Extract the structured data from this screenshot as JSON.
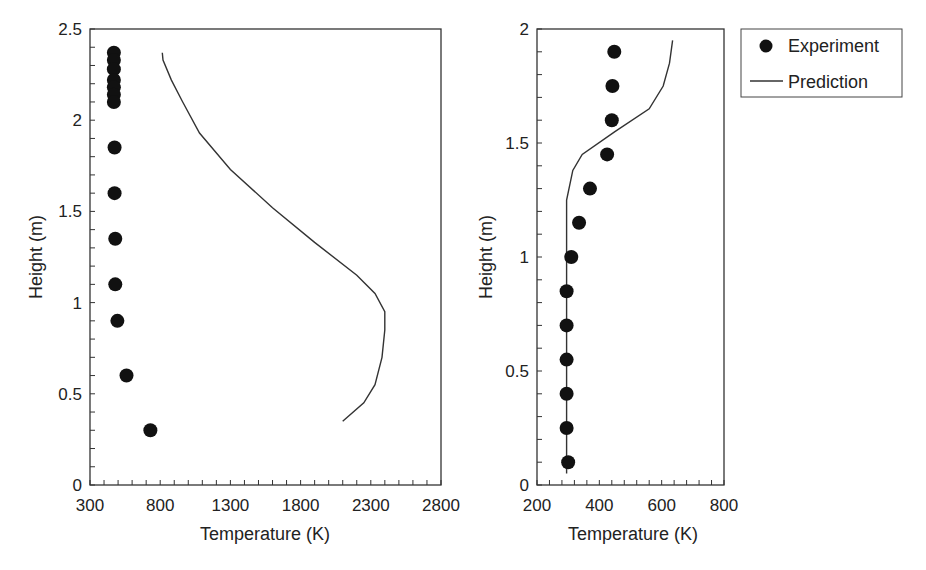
{
  "chart_data": [
    {
      "type": "scatter",
      "title": "",
      "xlabel": "Temperature (K)",
      "ylabel": "Height (m)",
      "xlim": [
        300,
        2800
      ],
      "ylim": [
        0,
        2.5
      ],
      "xticks": [
        300,
        800,
        1300,
        1800,
        2300,
        2800
      ],
      "yticks": [
        0,
        0.5,
        1,
        1.5,
        2,
        2.5
      ],
      "grid": false,
      "series": [
        {
          "name": "Experiment",
          "marker": "filled-circle",
          "points": [
            {
              "x": 470,
              "y": 2.37
            },
            {
              "x": 470,
              "y": 2.33
            },
            {
              "x": 470,
              "y": 2.28
            },
            {
              "x": 470,
              "y": 2.22
            },
            {
              "x": 470,
              "y": 2.18
            },
            {
              "x": 470,
              "y": 2.14
            },
            {
              "x": 470,
              "y": 2.1
            },
            {
              "x": 475,
              "y": 1.85
            },
            {
              "x": 475,
              "y": 1.6
            },
            {
              "x": 480,
              "y": 1.35
            },
            {
              "x": 480,
              "y": 1.1
            },
            {
              "x": 495,
              "y": 0.9
            },
            {
              "x": 560,
              "y": 0.6
            },
            {
              "x": 730,
              "y": 0.3
            }
          ]
        },
        {
          "name": "Prediction",
          "marker": "line",
          "points": [
            {
              "x": 2100,
              "y": 0.35
            },
            {
              "x": 2250,
              "y": 0.45
            },
            {
              "x": 2330,
              "y": 0.55
            },
            {
              "x": 2380,
              "y": 0.7
            },
            {
              "x": 2400,
              "y": 0.85
            },
            {
              "x": 2400,
              "y": 0.95
            },
            {
              "x": 2330,
              "y": 1.05
            },
            {
              "x": 2200,
              "y": 1.15
            },
            {
              "x": 1900,
              "y": 1.33
            },
            {
              "x": 1600,
              "y": 1.52
            },
            {
              "x": 1300,
              "y": 1.73
            },
            {
              "x": 1080,
              "y": 1.93
            },
            {
              "x": 960,
              "y": 2.1
            },
            {
              "x": 880,
              "y": 2.22
            },
            {
              "x": 820,
              "y": 2.33
            },
            {
              "x": 815,
              "y": 2.37
            }
          ]
        }
      ]
    },
    {
      "type": "scatter",
      "title": "",
      "xlabel": "Temperature (K)",
      "ylabel": "Height (m)",
      "xlim": [
        200,
        800
      ],
      "ylim": [
        0,
        2
      ],
      "xticks": [
        200,
        400,
        600,
        800
      ],
      "yticks": [
        0,
        0.5,
        1,
        1.5,
        2
      ],
      "grid": false,
      "series": [
        {
          "name": "Experiment",
          "marker": "filled-circle",
          "points": [
            {
              "x": 300,
              "y": 0.1
            },
            {
              "x": 295,
              "y": 0.25
            },
            {
              "x": 295,
              "y": 0.4
            },
            {
              "x": 295,
              "y": 0.55
            },
            {
              "x": 295,
              "y": 0.7
            },
            {
              "x": 295,
              "y": 0.85
            },
            {
              "x": 310,
              "y": 1.0
            },
            {
              "x": 335,
              "y": 1.15
            },
            {
              "x": 370,
              "y": 1.3
            },
            {
              "x": 425,
              "y": 1.45
            },
            {
              "x": 440,
              "y": 1.6
            },
            {
              "x": 442,
              "y": 1.75
            },
            {
              "x": 448,
              "y": 1.9
            }
          ]
        },
        {
          "name": "Prediction",
          "marker": "line",
          "points": [
            {
              "x": 295,
              "y": 0.05
            },
            {
              "x": 295,
              "y": 1.25
            },
            {
              "x": 315,
              "y": 1.38
            },
            {
              "x": 345,
              "y": 1.45
            },
            {
              "x": 450,
              "y": 1.55
            },
            {
              "x": 560,
              "y": 1.65
            },
            {
              "x": 605,
              "y": 1.75
            },
            {
              "x": 625,
              "y": 1.85
            },
            {
              "x": 635,
              "y": 1.95
            }
          ]
        }
      ]
    }
  ],
  "legend": {
    "items": [
      {
        "label": "Experiment",
        "symbol": "filled-circle"
      },
      {
        "label": "Prediction",
        "symbol": "line"
      }
    ]
  },
  "left_chart": {
    "xlabel": "Temperature (K)",
    "ylabel": "Height (m)",
    "xtick_labels": [
      "300",
      "800",
      "1300",
      "1800",
      "2300",
      "2800"
    ],
    "ytick_labels": [
      "0",
      "0.5",
      "1",
      "1.5",
      "2",
      "2.5"
    ]
  },
  "right_chart": {
    "xlabel": "Temperature (K)",
    "ylabel": "Height (m)",
    "xtick_labels": [
      "200",
      "400",
      "600",
      "800"
    ],
    "ytick_labels": [
      "0",
      "0.5",
      "1",
      "1.5",
      "2"
    ]
  },
  "colors": {
    "ink": "#222222",
    "background": "#ffffff"
  }
}
